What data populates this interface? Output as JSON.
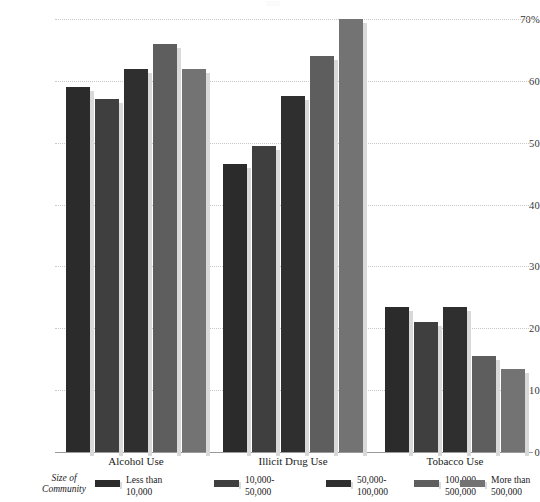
{
  "chart_data": {
    "type": "bar",
    "title": "",
    "subtitle": "",
    "xlabel": "",
    "ylabel": "",
    "ylim": [
      0,
      70
    ],
    "grid": true,
    "legend_position": "bottom",
    "legend_title": "Size of\nCommunity",
    "categories": [
      "Alcohol Use",
      "Illicit Drug Use",
      "Tobacco Use"
    ],
    "yticks": [
      "0",
      "10",
      "20",
      "30",
      "40",
      "50",
      "60",
      "70%"
    ],
    "ytick_values": [
      0,
      10,
      20,
      30,
      40,
      50,
      60,
      70
    ],
    "series": [
      {
        "name": "Less than\n10,000",
        "color": "#2b2b2b",
        "values": [
          59.0,
          46.5,
          23.5
        ]
      },
      {
        "name": "10,000-\n50,000",
        "color": "#3f3f3f",
        "values": [
          57.0,
          49.5,
          21.0
        ]
      },
      {
        "name": "50,000-\n100,000",
        "color": "#2f2f2f",
        "values": [
          62.0,
          57.5,
          23.5
        ]
      },
      {
        "name": "100,000-\n500,000",
        "color": "#5e5e5e",
        "values": [
          66.0,
          64.0,
          15.5
        ]
      },
      {
        "name": "More than\n500,000",
        "color": "#737373",
        "values": [
          62.0,
          70.0,
          13.5
        ]
      }
    ]
  },
  "colors": {
    "background": "#ffffff",
    "text": "#1a1a1a",
    "gridline": "#c8c8c8",
    "axis": "#9a9a9a",
    "bar_shadow": "#d9d9d9"
  }
}
